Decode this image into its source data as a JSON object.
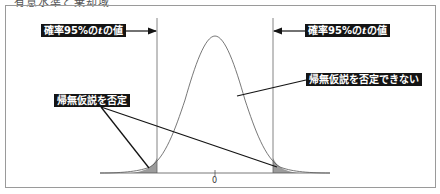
{
  "caption": "有意水準と棄却域",
  "labels": {
    "left_t_value": {
      "prefix": "確率95%の",
      "var": "t",
      "suffix": "の値"
    },
    "right_t_value": {
      "prefix": "確率95%の",
      "var": "t",
      "suffix": "の値"
    },
    "reject": "帰無仮説を否定",
    "not_reject": "帰無仮説を否定できない"
  },
  "axis": {
    "center_tick": "0"
  },
  "colors": {
    "frame": "#9a9a9a",
    "curve": "#555555",
    "tail_fill": "#9c9c9c",
    "label_bg": "#141414",
    "label_text": "#ffffff"
  }
}
